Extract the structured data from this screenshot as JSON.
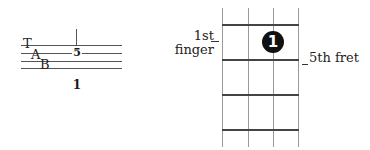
{
  "tab": {
    "clef_letters": [
      "T",
      "A",
      "B"
    ],
    "note_fret": "5",
    "note_string": 2,
    "beat_label": "1"
  },
  "fretboard": {
    "strings_shown": 4,
    "frets_shown": 4,
    "finger_dot": {
      "label": "1",
      "fret_position": 1,
      "string_index": 3
    },
    "left_annotation": [
      "1st",
      "finger"
    ],
    "right_annotation": "5th fret"
  },
  "colors": {
    "ink": "#1a1a1a",
    "grid_vertical": "#999999",
    "grid_horizontal": "#444444",
    "dot_fill": "#111111"
  }
}
